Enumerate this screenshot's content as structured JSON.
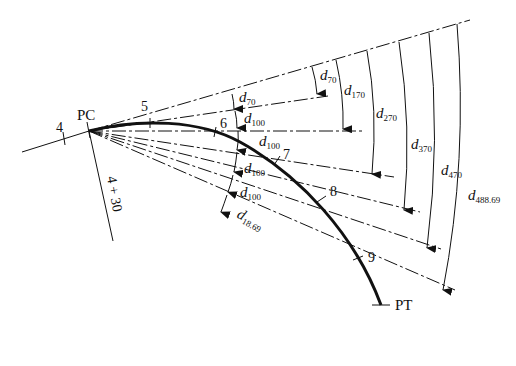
{
  "diagram": {
    "points": {
      "pc": "PC",
      "pt": "PT",
      "station_4": "4",
      "station_5": "5",
      "station_6": "6",
      "station_7": "7",
      "station_8": "8",
      "station_9": "9",
      "pc_station": "4 + 30"
    },
    "inner_deflections": [
      {
        "var": "d",
        "sub": "70"
      },
      {
        "var": "d",
        "sub": "100"
      },
      {
        "var": "d",
        "sub": "100"
      },
      {
        "var": "d",
        "sub": "100"
      },
      {
        "var": "d",
        "sub": "100"
      },
      {
        "var": "d",
        "sub": "18.69"
      }
    ],
    "cumulative_deflections": [
      {
        "var": "d",
        "sub": "70"
      },
      {
        "var": "d",
        "sub": "170"
      },
      {
        "var": "d",
        "sub": "270"
      },
      {
        "var": "d",
        "sub": "370"
      },
      {
        "var": "d",
        "sub": "470"
      },
      {
        "var": "d",
        "sub": "488.69"
      }
    ],
    "colors": {
      "line": "#111111",
      "background": "#ffffff"
    }
  }
}
